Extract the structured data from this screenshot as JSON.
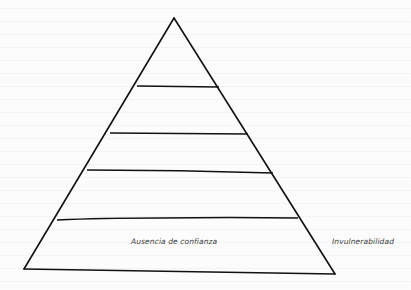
{
  "diagram": {
    "type": "pyramid",
    "levels": 5,
    "line_color": "#111111",
    "labels": {
      "base_level": "Ausencia de confianza",
      "base_side_note": "Invulnerabilidad"
    }
  }
}
